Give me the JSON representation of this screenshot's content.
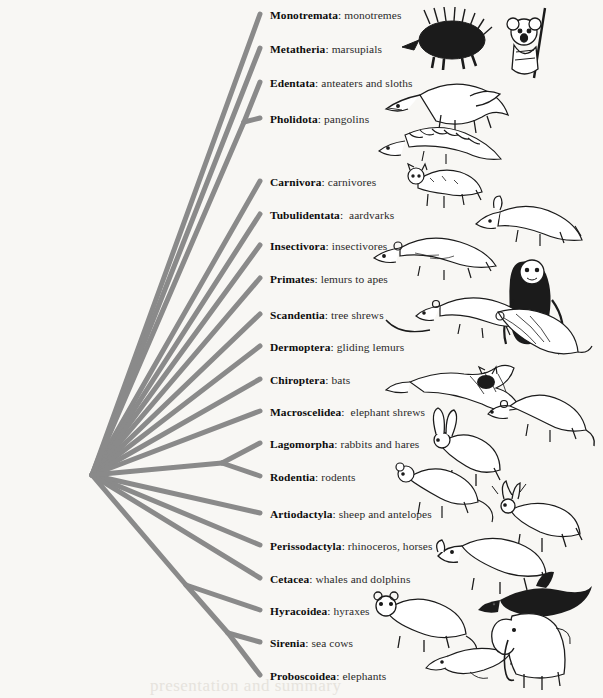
{
  "figure": {
    "background_color": "#f8f7f4",
    "branch_color": "#8a8a8a",
    "text_color": "#111111",
    "watermark_text": "presentation and summary"
  },
  "tree": {
    "root_node": {
      "x": 92,
      "y": 475
    },
    "tip_x": 260,
    "internal_nodes": [
      {
        "name": "edentata-pholidota-node",
        "x": 244,
        "y": 122
      },
      {
        "name": "lagomorpha-rodentia-node",
        "x": 222,
        "y": 463
      },
      {
        "name": "paenungulata-node",
        "x": 186,
        "y": 585
      },
      {
        "name": "sirenia-proboscoidea-node",
        "x": 228,
        "y": 633
      }
    ]
  },
  "taxa": [
    {
      "id": "monotremata",
      "name": "Monotremata",
      "common": "monotremes",
      "label_y": 10,
      "tip_y": 14,
      "icon": "echidna-illustration"
    },
    {
      "id": "metatheria",
      "name": "Metatheria",
      "common": "marsupials",
      "label_y": 44,
      "tip_y": 48,
      "icon": "koala-illustration"
    },
    {
      "id": "edentata",
      "name": "Edentata",
      "common": "anteaters and sloths",
      "label_y": 78,
      "tip_y": 82,
      "icon": "anteater-illustration"
    },
    {
      "id": "pholidota",
      "name": "Pholidota",
      "common": "pangolins",
      "label_y": 114,
      "tip_y": 118,
      "icon": "pangolin-illustration"
    },
    {
      "id": "carnivora",
      "name": "Carnivora",
      "common": "carnivores",
      "label_y": 177,
      "tip_y": 181,
      "icon": "carnivore-illustration"
    },
    {
      "id": "tubulidentata",
      "name": "Tubulidentata",
      "common": " aardvarks",
      "label_y": 210,
      "tip_y": 214,
      "icon": "aardvark-illustration"
    },
    {
      "id": "insectivora",
      "name": "Insectivora",
      "common": "insectivores",
      "label_y": 241,
      "tip_y": 245,
      "icon": "shrew-illustration"
    },
    {
      "id": "primates",
      "name": "Primates",
      "common": "lemurs to apes",
      "label_y": 274,
      "tip_y": 278,
      "icon": "monkey-illustration"
    },
    {
      "id": "scandentia",
      "name": "Scandentia",
      "common": "tree shrews",
      "label_y": 310,
      "tip_y": 314,
      "icon": "tree-shrew-illustration"
    },
    {
      "id": "dermoptera",
      "name": "Dermoptera",
      "common": "gliding lemurs",
      "label_y": 342,
      "tip_y": 346,
      "icon": "colugo-illustration"
    },
    {
      "id": "chiroptera",
      "name": "Chiroptera",
      "common": "bats",
      "label_y": 375,
      "tip_y": 379,
      "icon": "bat-illustration"
    },
    {
      "id": "macroscelidea",
      "name": "Macroscelidea",
      "common": " elephant shrews",
      "label_y": 407,
      "tip_y": 411,
      "icon": "elephant-shrew-illustration"
    },
    {
      "id": "lagomorpha",
      "name": "Lagomorpha",
      "common": "rabbits and hares",
      "label_y": 439,
      "tip_y": 443,
      "icon": "hare-illustration"
    },
    {
      "id": "rodentia",
      "name": "Rodentia",
      "common": "rodents",
      "label_y": 472,
      "tip_y": 476,
      "icon": "rodent-illustration"
    },
    {
      "id": "artiodactyla",
      "name": "Artiodactyla",
      "common": "sheep and antelopes",
      "label_y": 509,
      "tip_y": 513,
      "icon": "deer-illustration"
    },
    {
      "id": "perissodactyla",
      "name": "Perissodactyla",
      "common": "rhinoceros, horses",
      "label_y": 541,
      "tip_y": 545,
      "icon": "rhino-illustration"
    },
    {
      "id": "cetacea",
      "name": "Cetacea",
      "common": "whales and dolphins",
      "label_y": 574,
      "tip_y": 578,
      "icon": "dolphin-illustration"
    },
    {
      "id": "hyracoidea",
      "name": "Hyracoidea",
      "common": "hyraxes",
      "label_y": 606,
      "tip_y": 610,
      "icon": "hyrax-illustration"
    },
    {
      "id": "sirenia",
      "name": "Sirenia",
      "common": "sea cows",
      "label_y": 638,
      "tip_y": 642,
      "icon": "manatee-illustration"
    },
    {
      "id": "proboscoidea",
      "name": "Proboscoidea",
      "common": "elephants",
      "label_y": 671,
      "tip_y": 675,
      "icon": "elephant-illustration"
    }
  ]
}
